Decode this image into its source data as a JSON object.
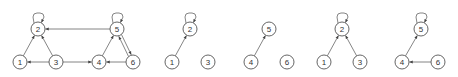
{
  "diagram": {
    "type": "directed-graph-decomposition",
    "node_radius": 7,
    "colors": {
      "stroke": "#555555",
      "edge": "#666666",
      "label": "#333333",
      "background": "#ffffff"
    },
    "graphs": [
      {
        "id": "full",
        "nodes": [
          {
            "label": "1",
            "x": 20,
            "y": 62
          },
          {
            "label": "2",
            "x": 38,
            "y": 29
          },
          {
            "label": "3",
            "x": 56,
            "y": 62
          },
          {
            "label": "4",
            "x": 99,
            "y": 62
          },
          {
            "label": "5",
            "x": 117,
            "y": 29
          },
          {
            "label": "6",
            "x": 133,
            "y": 62
          }
        ],
        "edges": [
          {
            "from": "1",
            "to": "2"
          },
          {
            "from": "3",
            "to": "2"
          },
          {
            "from": "3",
            "to": "1"
          },
          {
            "from": "3",
            "to": "4"
          },
          {
            "from": "5",
            "to": "2"
          },
          {
            "from": "4",
            "to": "5"
          },
          {
            "from": "5",
            "to": "6",
            "offset": -1.6
          },
          {
            "from": "6",
            "to": "5",
            "offset": -1.6
          },
          {
            "from": "6",
            "to": "4"
          },
          {
            "from": "2",
            "to": "2"
          },
          {
            "from": "5",
            "to": "5"
          }
        ]
      },
      {
        "id": "subgraph-1",
        "nodes": [
          {
            "label": "2",
            "x": 190,
            "y": 29
          },
          {
            "label": "1",
            "x": 172,
            "y": 62
          },
          {
            "label": "3",
            "x": 208,
            "y": 62
          }
        ],
        "edges": [
          {
            "from": "1",
            "to": "2"
          },
          {
            "from": "2",
            "to": "2"
          }
        ]
      },
      {
        "id": "subgraph-2",
        "nodes": [
          {
            "label": "5",
            "x": 269,
            "y": 29
          },
          {
            "label": "4",
            "x": 251,
            "y": 62
          },
          {
            "label": "6",
            "x": 287,
            "y": 62
          }
        ],
        "edges": [
          {
            "from": "4",
            "to": "5"
          }
        ]
      },
      {
        "id": "subgraph-3",
        "nodes": [
          {
            "label": "2",
            "x": 342,
            "y": 29
          },
          {
            "label": "1",
            "x": 324,
            "y": 62
          },
          {
            "label": "3",
            "x": 360,
            "y": 62
          }
        ],
        "edges": [
          {
            "from": "1",
            "to": "2"
          },
          {
            "from": "3",
            "to": "2"
          },
          {
            "from": "2",
            "to": "2"
          }
        ]
      },
      {
        "id": "subgraph-4",
        "nodes": [
          {
            "label": "5",
            "x": 421,
            "y": 29
          },
          {
            "label": "4",
            "x": 402,
            "y": 62
          },
          {
            "label": "6",
            "x": 438,
            "y": 62
          }
        ],
        "edges": [
          {
            "from": "4",
            "to": "5"
          },
          {
            "from": "6",
            "to": "4"
          },
          {
            "from": "5",
            "to": "5"
          }
        ]
      }
    ]
  }
}
